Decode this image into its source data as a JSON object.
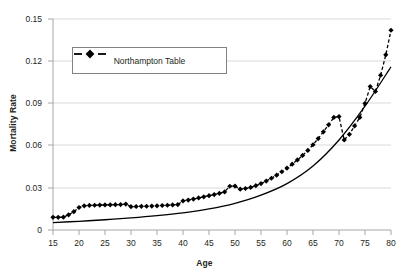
{
  "chart_data": {
    "type": "line",
    "title": "",
    "xlabel": "Age",
    "ylabel": "Mortality Rate",
    "xlim": [
      15,
      80
    ],
    "ylim": [
      0,
      0.15
    ],
    "xticks": [
      15,
      20,
      25,
      30,
      35,
      40,
      45,
      50,
      55,
      60,
      65,
      70,
      75,
      80
    ],
    "yticks": [
      0,
      0.03,
      0.06,
      0.09,
      0.12,
      0.15
    ],
    "ytick_labels": [
      "0",
      "0.03",
      "0.06",
      "0.09",
      "0.12",
      "0.15"
    ],
    "xtick_labels": [
      "15",
      "20",
      "25",
      "30",
      "35",
      "40",
      "45",
      "50",
      "55",
      "60",
      "65",
      "70",
      "75",
      "80"
    ],
    "grid": "horizontal",
    "legend_position": "upper-left-inside",
    "colors": {
      "data_series": "#000000",
      "fitted_curve": "#000000",
      "gridline": "#d9d9d9",
      "axis": "#a6a6a6",
      "legend_border": "#808285",
      "text": "#231f20",
      "background": "#ffffff"
    },
    "series": [
      {
        "name": "Northampton Table",
        "style": "dashed-with-diamond-markers",
        "x": [
          15,
          16,
          17,
          18,
          19,
          20,
          21,
          22,
          23,
          24,
          25,
          26,
          27,
          28,
          29,
          30,
          31,
          32,
          33,
          34,
          35,
          36,
          37,
          38,
          39,
          40,
          41,
          42,
          43,
          44,
          45,
          46,
          47,
          48,
          49,
          50,
          51,
          52,
          53,
          54,
          55,
          56,
          57,
          58,
          59,
          60,
          61,
          62,
          63,
          64,
          65,
          66,
          67,
          68,
          69,
          70,
          71,
          72,
          73,
          74,
          75,
          76,
          77,
          78,
          79,
          80
        ],
        "values": [
          0.009,
          0.009,
          0.0091,
          0.0108,
          0.013,
          0.016,
          0.0172,
          0.0175,
          0.0176,
          0.0177,
          0.0178,
          0.0179,
          0.018,
          0.0181,
          0.0184,
          0.0166,
          0.0167,
          0.0168,
          0.0169,
          0.017,
          0.0172,
          0.0174,
          0.0176,
          0.0178,
          0.0181,
          0.0207,
          0.0213,
          0.022,
          0.0228,
          0.0236,
          0.0244,
          0.0252,
          0.0261,
          0.0271,
          0.0311,
          0.0312,
          0.029,
          0.0295,
          0.0303,
          0.0315,
          0.033,
          0.0348,
          0.0368,
          0.039,
          0.0414,
          0.044,
          0.0468,
          0.0498,
          0.053,
          0.0566,
          0.0606,
          0.065,
          0.0698,
          0.0748,
          0.08,
          0.0806,
          0.064,
          0.068,
          0.074,
          0.08,
          0.09,
          0.102,
          0.0985,
          0.11,
          0.1245,
          0.142
        ]
      },
      {
        "name": "Fitted curve",
        "style": "solid-smooth-no-markers",
        "x": [
          15,
          20,
          25,
          30,
          35,
          40,
          45,
          50,
          55,
          60,
          65,
          70,
          75,
          80
        ],
        "values": [
          0.0053,
          0.0062,
          0.0073,
          0.0086,
          0.0102,
          0.0122,
          0.015,
          0.019,
          0.0248,
          0.033,
          0.0455,
          0.064,
          0.088,
          0.116
        ]
      }
    ],
    "annotations": []
  },
  "legend": {
    "entries": [
      {
        "label": "Northampton Table",
        "marker": "diamond-marker-icon",
        "line": "dashed"
      }
    ]
  }
}
